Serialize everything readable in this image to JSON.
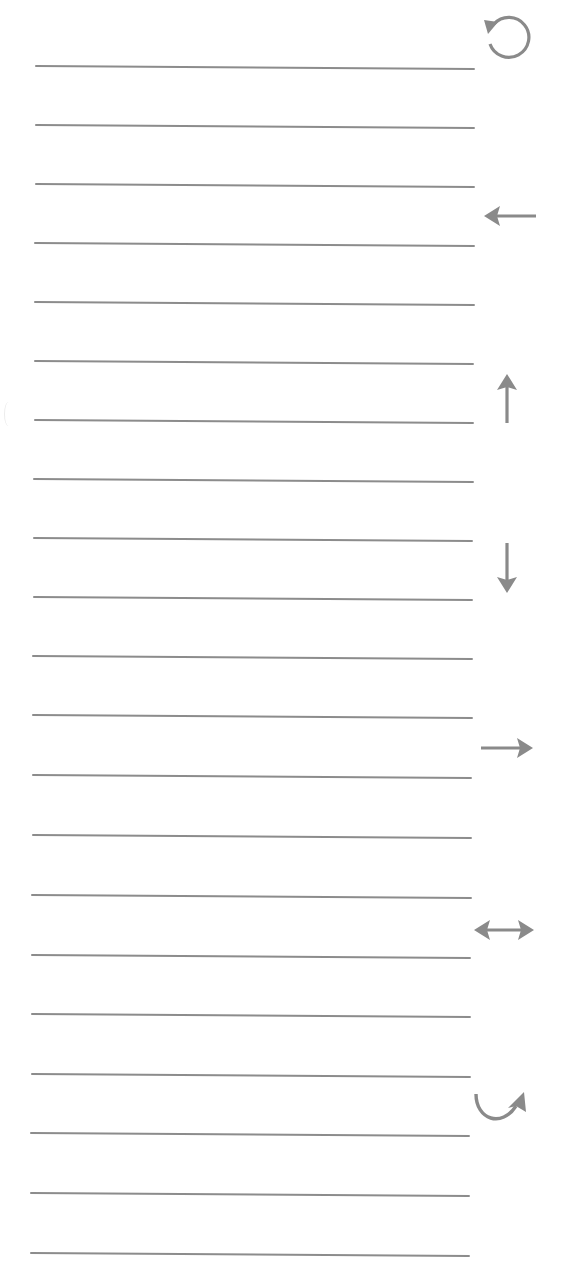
{
  "page": {
    "background_color": "#ffffff",
    "line_color": "#8c8c8c",
    "icon_color": "#8a8a8a"
  },
  "lines": [
    {
      "index": 1,
      "x1": 35,
      "y1": 66,
      "x2": 475,
      "y2": 69
    },
    {
      "index": 2,
      "x1": 35,
      "y1": 125,
      "x2": 475,
      "y2": 128
    },
    {
      "index": 3,
      "x1": 35,
      "y1": 184,
      "x2": 475,
      "y2": 187
    },
    {
      "index": 4,
      "x1": 34,
      "y1": 243,
      "x2": 475,
      "y2": 246
    },
    {
      "index": 5,
      "x1": 34,
      "y1": 302,
      "x2": 475,
      "y2": 305
    },
    {
      "index": 6,
      "x1": 34,
      "y1": 361,
      "x2": 474,
      "y2": 364
    },
    {
      "index": 7,
      "x1": 34,
      "y1": 420,
      "x2": 474,
      "y2": 423
    },
    {
      "index": 8,
      "x1": 33,
      "y1": 479,
      "x2": 474,
      "y2": 482
    },
    {
      "index": 9,
      "x1": 33,
      "y1": 538,
      "x2": 473,
      "y2": 541
    },
    {
      "index": 10,
      "x1": 33,
      "y1": 597,
      "x2": 473,
      "y2": 600
    },
    {
      "index": 11,
      "x1": 32,
      "y1": 656,
      "x2": 473,
      "y2": 659
    },
    {
      "index": 12,
      "x1": 32,
      "y1": 715,
      "x2": 473,
      "y2": 718
    },
    {
      "index": 13,
      "x1": 32,
      "y1": 775,
      "x2": 472,
      "y2": 778
    },
    {
      "index": 14,
      "x1": 32,
      "y1": 835,
      "x2": 472,
      "y2": 838
    },
    {
      "index": 15,
      "x1": 31,
      "y1": 895,
      "x2": 472,
      "y2": 898
    },
    {
      "index": 16,
      "x1": 31,
      "y1": 955,
      "x2": 471,
      "y2": 958
    },
    {
      "index": 17,
      "x1": 31,
      "y1": 1014,
      "x2": 471,
      "y2": 1017
    },
    {
      "index": 18,
      "x1": 31,
      "y1": 1074,
      "x2": 471,
      "y2": 1077
    },
    {
      "index": 19,
      "x1": 30,
      "y1": 1133,
      "x2": 470,
      "y2": 1136
    },
    {
      "index": 20,
      "x1": 30,
      "y1": 1193,
      "x2": 470,
      "y2": 1196
    },
    {
      "index": 21,
      "x1": 30,
      "y1": 1253,
      "x2": 470,
      "y2": 1256
    }
  ],
  "icons": [
    {
      "name": "rotate-counterclockwise-icon",
      "x": 472,
      "y": 4,
      "w": 64,
      "h": 64
    },
    {
      "name": "arrow-left-icon",
      "x": 478,
      "y": 184,
      "w": 64,
      "h": 64
    },
    {
      "name": "arrow-up-icon",
      "x": 475,
      "y": 366,
      "w": 64,
      "h": 64
    },
    {
      "name": "arrow-down-icon",
      "x": 475,
      "y": 537,
      "w": 64,
      "h": 64
    },
    {
      "name": "arrow-right-icon",
      "x": 475,
      "y": 716,
      "w": 64,
      "h": 64
    },
    {
      "name": "arrow-left-right-icon",
      "x": 470,
      "y": 898,
      "w": 64,
      "h": 64
    },
    {
      "name": "curved-arrow-up-right-icon",
      "x": 468,
      "y": 1078,
      "w": 64,
      "h": 64
    }
  ]
}
